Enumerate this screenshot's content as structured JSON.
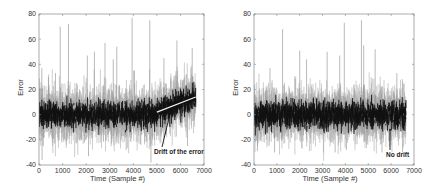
{
  "chart_data": [
    {
      "type": "line",
      "panel": "left",
      "title": "",
      "xlabel": "Time (Sample #)",
      "ylabel": "Error",
      "xlim": [
        0,
        7000
      ],
      "ylim": [
        -40,
        80
      ],
      "xticks": [
        0,
        1000,
        2000,
        3000,
        4000,
        5000,
        6000,
        7000
      ],
      "yticks": [
        -40,
        -20,
        0,
        20,
        40,
        60,
        80
      ],
      "grid": false,
      "series": [
        {
          "name": "Error",
          "n_samples": 6650,
          "baseline_noise_band": [
            -10,
            12
          ],
          "spikes": [
            {
              "x": 120,
              "y": 37
            },
            {
              "x": 130,
              "y": -36
            },
            {
              "x": 400,
              "y": 30
            },
            {
              "x": 700,
              "y": 33
            },
            {
              "x": 900,
              "y": 70
            },
            {
              "x": 1250,
              "y": 72
            },
            {
              "x": 1600,
              "y": 25
            },
            {
              "x": 2050,
              "y": 47
            },
            {
              "x": 2100,
              "y": -33
            },
            {
              "x": 2350,
              "y": 50
            },
            {
              "x": 2800,
              "y": 57
            },
            {
              "x": 3150,
              "y": 44
            },
            {
              "x": 3300,
              "y": 54
            },
            {
              "x": 3700,
              "y": -28
            },
            {
              "x": 3950,
              "y": 77
            },
            {
              "x": 4050,
              "y": 35
            },
            {
              "x": 4700,
              "y": 75
            },
            {
              "x": 4750,
              "y": -38
            },
            {
              "x": 5300,
              "y": 45
            },
            {
              "x": 5850,
              "y": 59
            },
            {
              "x": 6300,
              "y": -25
            },
            {
              "x": 6500,
              "y": 53
            }
          ],
          "trend": {
            "from": {
              "x": 5000,
              "y": 2
            },
            "to": {
              "x": 6650,
              "y": 14
            }
          }
        }
      ],
      "annotations": [
        {
          "text": "Drift of the error",
          "arrow_to": {
            "x": 5600,
            "y": 4
          }
        }
      ]
    },
    {
      "type": "line",
      "panel": "right",
      "title": "",
      "xlabel": "Time (Sample #)",
      "ylabel": "Error",
      "xlim": [
        0,
        7000
      ],
      "ylim": [
        -40,
        80
      ],
      "xticks": [
        0,
        1000,
        2000,
        3000,
        4000,
        5000,
        6000,
        7000
      ],
      "yticks": [
        -40,
        -20,
        0,
        20,
        40,
        60,
        80
      ],
      "grid": false,
      "series": [
        {
          "name": "Error",
          "n_samples": 6650,
          "baseline_noise_band": [
            -10,
            10
          ],
          "spikes": [
            {
              "x": 150,
              "y": -29
            },
            {
              "x": 700,
              "y": 37
            },
            {
              "x": 900,
              "y": -30
            },
            {
              "x": 1250,
              "y": 68
            },
            {
              "x": 2000,
              "y": 51
            },
            {
              "x": 2300,
              "y": 44
            },
            {
              "x": 3200,
              "y": 50
            },
            {
              "x": 3550,
              "y": -30
            },
            {
              "x": 3750,
              "y": 47
            },
            {
              "x": 3950,
              "y": 73
            },
            {
              "x": 4700,
              "y": 75
            },
            {
              "x": 4800,
              "y": 55
            },
            {
              "x": 5300,
              "y": 52
            },
            {
              "x": 5600,
              "y": -30
            },
            {
              "x": 6250,
              "y": 33
            },
            {
              "x": 6500,
              "y": -30
            }
          ],
          "trend": null
        }
      ],
      "annotations": [
        {
          "text": "No drift",
          "arrow_to": {
            "x": 5950,
            "y": -12
          }
        }
      ]
    }
  ]
}
